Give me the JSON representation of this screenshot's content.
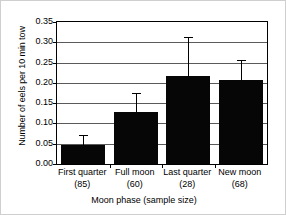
{
  "chart_data": {
    "type": "bar",
    "title": "",
    "xlabel": "Moon phase (sample size)",
    "ylabel": "Number of eels per 10 min tow",
    "categories": [
      "First quarter",
      "Full moon",
      "Last quarter",
      "New moon"
    ],
    "sample_sizes": [
      "(85)",
      "(60)",
      "(28)",
      "(68)"
    ],
    "category_labels": [
      "First quarter\n(85)",
      "Full moon\n(60)",
      "Last quarter\n(28)",
      "New moon\n(68)"
    ],
    "values": [
      0.048,
      0.127,
      0.217,
      0.207
    ],
    "error_high": [
      0.071,
      0.175,
      0.312,
      0.257
    ],
    "error_low": [
      0.048,
      0.127,
      0.217,
      0.207
    ],
    "ylim": [
      0.0,
      0.35
    ],
    "yticks": [
      0.0,
      0.05,
      0.1,
      0.15,
      0.2,
      0.25,
      0.3,
      0.35
    ],
    "ytick_labels": [
      "0.00",
      "0.05",
      "0.10",
      "0.15",
      "0.20",
      "0.25",
      "0.30",
      "0.35"
    ],
    "grid": "horizontal",
    "legend": "none",
    "bar_color": "#060606",
    "grid_color": "#5a5a5a",
    "axis_color": "#000000",
    "background_color": "#ffffff"
  }
}
